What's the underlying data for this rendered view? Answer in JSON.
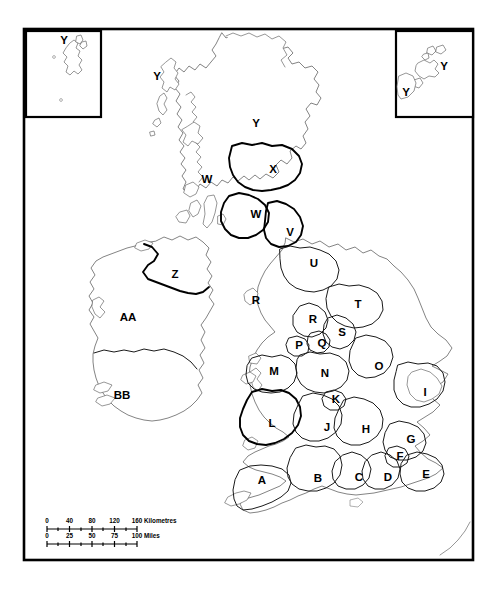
{
  "map": {
    "title": "British Isles regional outline map",
    "background_color": "#ffffff",
    "outline_color": "#5a5a5a",
    "border_color": "#1a1a1a",
    "frame_color": "#000000",
    "label_color": "#000000"
  },
  "insets": [
    {
      "name": "shetland-inset",
      "label": "Y",
      "position": "top-left"
    },
    {
      "name": "orkney-inset",
      "labels": [
        "Y",
        "Y"
      ],
      "label_main": "Y",
      "label_secondary": "Y",
      "position": "top-right"
    }
  ],
  "regions": [
    {
      "id": "A",
      "label": "A",
      "x": 262,
      "y": 481
    },
    {
      "id": "B",
      "label": "B",
      "x": 318,
      "y": 479
    },
    {
      "id": "C",
      "label": "C",
      "x": 359,
      "y": 478
    },
    {
      "id": "D",
      "label": "D",
      "x": 388,
      "y": 478
    },
    {
      "id": "E",
      "label": "E",
      "x": 426,
      "y": 475
    },
    {
      "id": "F",
      "label": "F",
      "x": 400,
      "y": 457
    },
    {
      "id": "G",
      "label": "G",
      "x": 411,
      "y": 440
    },
    {
      "id": "H",
      "label": "H",
      "x": 366,
      "y": 430
    },
    {
      "id": "I",
      "label": "I",
      "x": 425,
      "y": 393
    },
    {
      "id": "J",
      "label": "J",
      "x": 327,
      "y": 428
    },
    {
      "id": "K",
      "label": "K",
      "x": 336,
      "y": 400
    },
    {
      "id": "L",
      "label": "L",
      "x": 272,
      "y": 424
    },
    {
      "id": "M",
      "label": "M",
      "x": 274,
      "y": 372
    },
    {
      "id": "N",
      "label": "N",
      "x": 325,
      "y": 374
    },
    {
      "id": "O",
      "label": "O",
      "x": 379,
      "y": 367
    },
    {
      "id": "P",
      "label": "P",
      "x": 299,
      "y": 346
    },
    {
      "id": "Q",
      "label": "Q",
      "x": 322,
      "y": 344
    },
    {
      "id": "R1",
      "label": "R",
      "x": 313,
      "y": 320
    },
    {
      "id": "R2",
      "label": "R",
      "x": 256,
      "y": 301
    },
    {
      "id": "S",
      "label": "S",
      "x": 342,
      "y": 333
    },
    {
      "id": "T",
      "label": "T",
      "x": 358,
      "y": 305
    },
    {
      "id": "U",
      "label": "U",
      "x": 314,
      "y": 264
    },
    {
      "id": "V",
      "label": "V",
      "x": 290,
      "y": 233
    },
    {
      "id": "W1",
      "label": "W",
      "x": 256,
      "y": 215
    },
    {
      "id": "W2",
      "label": "W",
      "x": 207,
      "y": 180
    },
    {
      "id": "X",
      "label": "X",
      "x": 273,
      "y": 170
    },
    {
      "id": "Y1",
      "label": "Y",
      "x": 256,
      "y": 124
    },
    {
      "id": "Y2",
      "label": "Y",
      "x": 157,
      "y": 77
    },
    {
      "id": "Z",
      "label": "Z",
      "x": 175,
      "y": 275
    },
    {
      "id": "AA",
      "label": "AA",
      "x": 128,
      "y": 318
    },
    {
      "id": "BB",
      "label": "BB",
      "x": 122,
      "y": 396
    }
  ],
  "scale_bar": {
    "name": "map-scale-bar",
    "km": {
      "ticks": [
        "0",
        "40",
        "80",
        "120",
        "160"
      ],
      "unit_label": "Kilometres"
    },
    "miles": {
      "ticks": [
        "0",
        "25",
        "50",
        "75",
        "100"
      ],
      "unit_label": "Miles"
    }
  }
}
